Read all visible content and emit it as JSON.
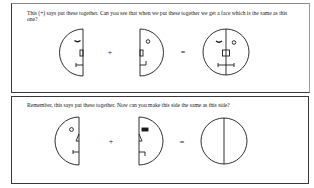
{
  "panels": [
    {
      "prompt": "This (+) says put these together. Can you see that when we put these together we get a face which is the same as this one?",
      "operator_plus": "+",
      "operator_equals": "=",
      "left_half": {
        "side": "left",
        "features": [
          "eyebrow-curve",
          "nose-rectangle",
          "mouth-bracket"
        ]
      },
      "right_half": {
        "side": "right",
        "features": [
          "eye-circle",
          "nose-rectangle",
          "mouth-bracket"
        ]
      },
      "result": {
        "type": "full-face",
        "features": [
          "eyebrow-curve",
          "eye-circle",
          "nose-square",
          "mouth-bar"
        ]
      }
    },
    {
      "prompt": "Remember, this says put these together. Now can you make this side the same as this side?",
      "operator_plus": "+",
      "operator_equals": "=",
      "left_half": {
        "side": "left",
        "features": [
          "eye-circle",
          "nose-triangle",
          "mouth-bracket"
        ]
      },
      "right_half": {
        "side": "right",
        "features": [
          "eye-filled-rectangle",
          "nose-triangle",
          "mouth-bracket"
        ]
      },
      "result": {
        "type": "empty-circle-divided",
        "features": []
      }
    }
  ],
  "colors": {
    "stroke": "#1a1a1a",
    "border": "#3a3a3a",
    "background": "#ffffff"
  }
}
